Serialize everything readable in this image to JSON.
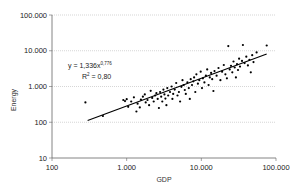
{
  "chart_data": {
    "type": "scatter",
    "title": "",
    "xlabel": "GDP",
    "ylabel": "Energy",
    "xscale": "log",
    "yscale": "log",
    "xlim": [
      100,
      100000
    ],
    "ylim": [
      10,
      100000
    ],
    "x_ticks": [
      "100",
      "1.000",
      "10.000",
      "100.000"
    ],
    "y_ticks": [
      "10",
      "100",
      "1.000",
      "10.000",
      "100.000"
    ],
    "grid": "horizontal dotted",
    "legend": "none",
    "annotation": {
      "equation": "y = 1,336x",
      "exponent": "0,776",
      "r2_label": "R",
      "r2_sup": "2",
      "r2_value": " = 0,80"
    },
    "trendline": {
      "type": "power",
      "a": 1.336,
      "b": 0.776,
      "x_range": [
        300,
        75000
      ]
    },
    "points": [
      [
        280,
        360
      ],
      [
        480,
        150
      ],
      [
        900,
        420
      ],
      [
        950,
        390
      ],
      [
        1000,
        440
      ],
      [
        1050,
        270
      ],
      [
        1150,
        380
      ],
      [
        1250,
        500
      ],
      [
        1350,
        200
      ],
      [
        1400,
        330
      ],
      [
        1500,
        260
      ],
      [
        1550,
        430
      ],
      [
        1650,
        520
      ],
      [
        1750,
        600
      ],
      [
        1800,
        360
      ],
      [
        1900,
        420
      ],
      [
        2000,
        300
      ],
      [
        2100,
        760
      ],
      [
        2200,
        480
      ],
      [
        2300,
        380
      ],
      [
        2400,
        560
      ],
      [
        2500,
        650
      ],
      [
        2600,
        450
      ],
      [
        2700,
        250
      ],
      [
        2800,
        700
      ],
      [
        2900,
        520
      ],
      [
        3000,
        380
      ],
      [
        3100,
        820
      ],
      [
        3200,
        600
      ],
      [
        3300,
        460
      ],
      [
        3400,
        300
      ],
      [
        3500,
        900
      ],
      [
        3600,
        560
      ],
      [
        3800,
        700
      ],
      [
        4000,
        1000
      ],
      [
        4100,
        450
      ],
      [
        4200,
        620
      ],
      [
        4400,
        820
      ],
      [
        4600,
        1250
      ],
      [
        4800,
        560
      ],
      [
        5000,
        700
      ],
      [
        5200,
        380
      ],
      [
        5400,
        980
      ],
      [
        5600,
        1500
      ],
      [
        5800,
        1100
      ],
      [
        6000,
        800
      ],
      [
        6200,
        620
      ],
      [
        6500,
        1300
      ],
      [
        6800,
        900
      ],
      [
        7000,
        450
      ],
      [
        7200,
        1600
      ],
      [
        7500,
        1100
      ],
      [
        7800,
        1400
      ],
      [
        8000,
        1800
      ],
      [
        8300,
        700
      ],
      [
        8600,
        2200
      ],
      [
        9000,
        1200
      ],
      [
        9400,
        1500
      ],
      [
        9800,
        2600
      ],
      [
        10200,
        900
      ],
      [
        10500,
        1700
      ],
      [
        11000,
        1300
      ],
      [
        11500,
        2000
      ],
      [
        12000,
        3000
      ],
      [
        12500,
        1100
      ],
      [
        13000,
        1800
      ],
      [
        13500,
        2400
      ],
      [
        14000,
        1600
      ],
      [
        14500,
        750
      ],
      [
        15000,
        2700
      ],
      [
        16000,
        2000
      ],
      [
        17000,
        3300
      ],
      [
        18000,
        1500
      ],
      [
        19000,
        2600
      ],
      [
        20000,
        4000
      ],
      [
        21000,
        2200
      ],
      [
        22000,
        1700
      ],
      [
        23000,
        13500
      ],
      [
        24000,
        3000
      ],
      [
        25000,
        3800
      ],
      [
        26000,
        2500
      ],
      [
        27000,
        5000
      ],
      [
        28000,
        3400
      ],
      [
        29000,
        1800
      ],
      [
        30000,
        4200
      ],
      [
        31000,
        2900
      ],
      [
        32000,
        6000
      ],
      [
        33000,
        3600
      ],
      [
        35000,
        5200
      ],
      [
        36000,
        14500
      ],
      [
        38000,
        4500
      ],
      [
        40000,
        6800
      ],
      [
        42000,
        3900
      ],
      [
        44000,
        5600
      ],
      [
        46000,
        2500
      ],
      [
        48000,
        7500
      ],
      [
        50000,
        4800
      ],
      [
        55000,
        9000
      ],
      [
        75000,
        14000
      ]
    ]
  }
}
